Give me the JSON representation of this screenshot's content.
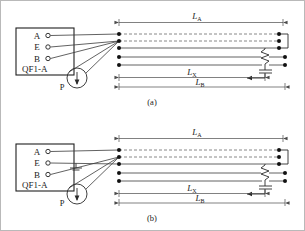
{
  "figure": {
    "type": "electrical-schematic",
    "panels": [
      {
        "id": "a",
        "caption": "(a)",
        "instrument_box": {
          "label": "QF1-A",
          "terminals": [
            "A",
            "E",
            "B"
          ]
        },
        "source": {
          "label": "P",
          "symbol": "circle-with-down-arrow"
        },
        "dimensions": [
          {
            "name": "L",
            "subscript": "A",
            "position": "top"
          },
          {
            "name": "L",
            "subscript": "X",
            "position": "bottom-upper"
          },
          {
            "name": "L",
            "subscript": "B",
            "position": "bottom-lower"
          }
        ],
        "components": [
          {
            "name": "fault-resistor",
            "symbol": "zigzag"
          },
          {
            "name": "capacitor",
            "symbol": "capacitor-with-arrow"
          }
        ],
        "ground_symbol": false,
        "wires_crossed": false
      },
      {
        "id": "b",
        "caption": "(b)",
        "instrument_box": {
          "label": "QF1-A",
          "terminals": [
            "A",
            "E",
            "B"
          ]
        },
        "source": {
          "label": "P",
          "symbol": "circle-with-down-arrow"
        },
        "dimensions": [
          {
            "name": "L",
            "subscript": "A",
            "position": "top"
          },
          {
            "name": "L",
            "subscript": "X",
            "position": "bottom-upper"
          },
          {
            "name": "L",
            "subscript": "B",
            "position": "bottom-lower"
          }
        ],
        "components": [
          {
            "name": "fault-resistor",
            "symbol": "zigzag"
          },
          {
            "name": "capacitor",
            "symbol": "capacitor-with-arrow"
          }
        ],
        "ground_symbol": true,
        "wires_crossed": true
      }
    ],
    "colors": {
      "ink": "#1f1f1f",
      "wire": "#3a3a3a",
      "dash": "#6a6a6a",
      "dimension": "#4a4a4a",
      "background": "#ffffff",
      "frame": "#b9b9b9"
    }
  }
}
